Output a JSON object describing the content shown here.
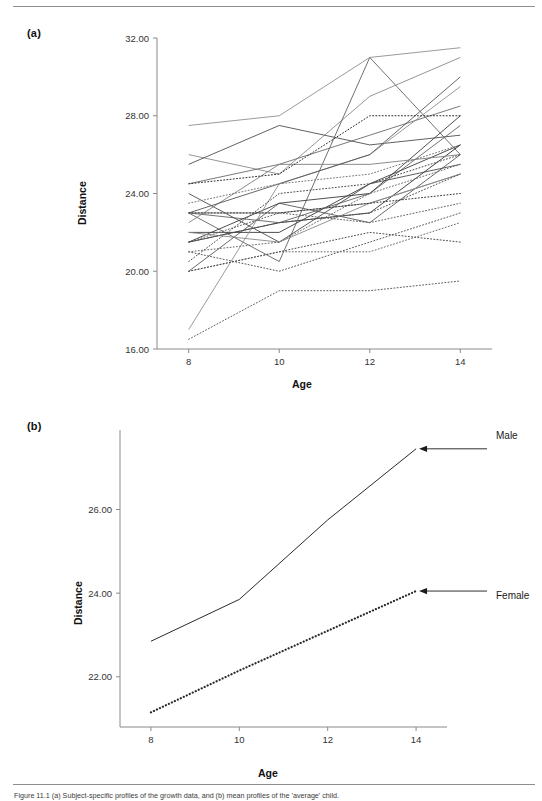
{
  "figure": {
    "panel_a_tag": "(a)",
    "panel_b_tag": "(b)",
    "caption": "Figure 11.1  (a) Subject-specific profiles of the growth data, and (b) mean profiles of the 'average' child."
  },
  "annotations": {
    "male_label": "Male",
    "female_label": "Female"
  },
  "chart_data": [
    {
      "panel": "(a)",
      "type": "line",
      "title": "",
      "xlabel": "Age",
      "ylabel": "Distance",
      "x": [
        8,
        10,
        12,
        14
      ],
      "xticks": [
        "8",
        "10",
        "12",
        "14"
      ],
      "yticks": [
        "16.00",
        "20.00",
        "24.00",
        "28.00",
        "32.00"
      ],
      "xlim": [
        7.3,
        14.7
      ],
      "ylim": [
        16,
        32
      ],
      "grid": false,
      "legend": "none",
      "series": [
        {
          "name": "M01",
          "sex": "Male",
          "style": "solid",
          "values": [
            26.0,
            25.0,
            29.0,
            31.0
          ]
        },
        {
          "name": "M02",
          "sex": "Male",
          "style": "solid",
          "values": [
            21.5,
            22.5,
            23.0,
            26.5
          ]
        },
        {
          "name": "M03",
          "sex": "Male",
          "style": "solid",
          "values": [
            23.0,
            22.5,
            24.0,
            27.5
          ]
        },
        {
          "name": "M04",
          "sex": "Male",
          "style": "solid",
          "values": [
            25.5,
            27.5,
            26.5,
            27.0
          ]
        },
        {
          "name": "M05",
          "sex": "Male",
          "style": "solid",
          "values": [
            20.0,
            23.5,
            22.5,
            26.0
          ]
        },
        {
          "name": "M06",
          "sex": "Male",
          "style": "solid",
          "values": [
            24.5,
            25.5,
            27.0,
            28.5
          ]
        },
        {
          "name": "M07",
          "sex": "Male",
          "style": "solid",
          "values": [
            22.0,
            22.0,
            24.5,
            26.5
          ]
        },
        {
          "name": "M08",
          "sex": "Male",
          "style": "solid",
          "values": [
            24.0,
            21.5,
            24.5,
            25.5
          ]
        },
        {
          "name": "M09",
          "sex": "Male",
          "style": "solid",
          "values": [
            23.0,
            20.5,
            31.0,
            26.0
          ]
        },
        {
          "name": "M10",
          "sex": "Male",
          "style": "solid",
          "values": [
            27.5,
            28.0,
            31.0,
            31.5
          ]
        },
        {
          "name": "M11",
          "sex": "Male",
          "style": "solid",
          "values": [
            23.0,
            23.0,
            23.5,
            25.0
          ]
        },
        {
          "name": "M12",
          "sex": "Male",
          "style": "solid",
          "values": [
            21.5,
            23.5,
            24.0,
            28.0
          ]
        },
        {
          "name": "M13",
          "sex": "Male",
          "style": "solid",
          "values": [
            17.0,
            24.5,
            26.0,
            29.5
          ]
        },
        {
          "name": "M14",
          "sex": "Male",
          "style": "solid",
          "values": [
            22.5,
            25.5,
            25.5,
            26.0
          ]
        },
        {
          "name": "M15",
          "sex": "Male",
          "style": "solid",
          "values": [
            23.0,
            24.5,
            26.0,
            30.0
          ]
        },
        {
          "name": "M16",
          "sex": "Male",
          "style": "solid",
          "values": [
            22.0,
            21.5,
            23.5,
            25.0
          ]
        },
        {
          "name": "F01",
          "sex": "Female",
          "style": "dotted",
          "values": [
            21.0,
            20.0,
            21.5,
            23.0
          ]
        },
        {
          "name": "F02",
          "sex": "Female",
          "style": "dotted",
          "values": [
            21.0,
            21.5,
            24.0,
            25.5
          ]
        },
        {
          "name": "F03",
          "sex": "Female",
          "style": "dotted",
          "values": [
            20.5,
            24.0,
            24.5,
            26.0
          ]
        },
        {
          "name": "F04",
          "sex": "Female",
          "style": "dotted",
          "values": [
            23.5,
            24.5,
            25.0,
            26.5
          ]
        },
        {
          "name": "F05",
          "sex": "Female",
          "style": "dotted",
          "values": [
            21.5,
            23.0,
            22.5,
            23.5
          ]
        },
        {
          "name": "F06",
          "sex": "Female",
          "style": "dotted",
          "values": [
            20.0,
            21.0,
            21.0,
            22.5
          ]
        },
        {
          "name": "F07",
          "sex": "Female",
          "style": "dotted",
          "values": [
            21.5,
            22.5,
            23.0,
            25.0
          ]
        },
        {
          "name": "F08",
          "sex": "Female",
          "style": "dotted",
          "values": [
            23.0,
            23.0,
            23.5,
            24.0
          ]
        },
        {
          "name": "F09",
          "sex": "Female",
          "style": "dotted",
          "values": [
            20.0,
            21.0,
            22.0,
            21.5
          ]
        },
        {
          "name": "F10",
          "sex": "Female",
          "style": "dotted",
          "values": [
            16.5,
            19.0,
            19.0,
            19.5
          ]
        },
        {
          "name": "F11",
          "sex": "Female",
          "style": "dotted",
          "values": [
            24.5,
            25.0,
            28.0,
            28.0
          ]
        }
      ]
    },
    {
      "panel": "(b)",
      "type": "line",
      "title": "",
      "xlabel": "Age",
      "ylabel": "Distance",
      "x": [
        8,
        10,
        12,
        14
      ],
      "xticks": [
        "8",
        "10",
        "12",
        "14"
      ],
      "yticks": [
        "22.00",
        "24.00",
        "26.00"
      ],
      "xlim": [
        7.3,
        14.7
      ],
      "ylim": [
        20.8,
        27.9
      ],
      "grid": false,
      "legend": "arrow-annotations",
      "series": [
        {
          "name": "Male",
          "style": "solid",
          "values": [
            22.85,
            23.85,
            25.75,
            27.45
          ]
        },
        {
          "name": "Female",
          "style": "dotted",
          "values": [
            21.15,
            22.15,
            23.1,
            24.05
          ]
        }
      ]
    }
  ]
}
